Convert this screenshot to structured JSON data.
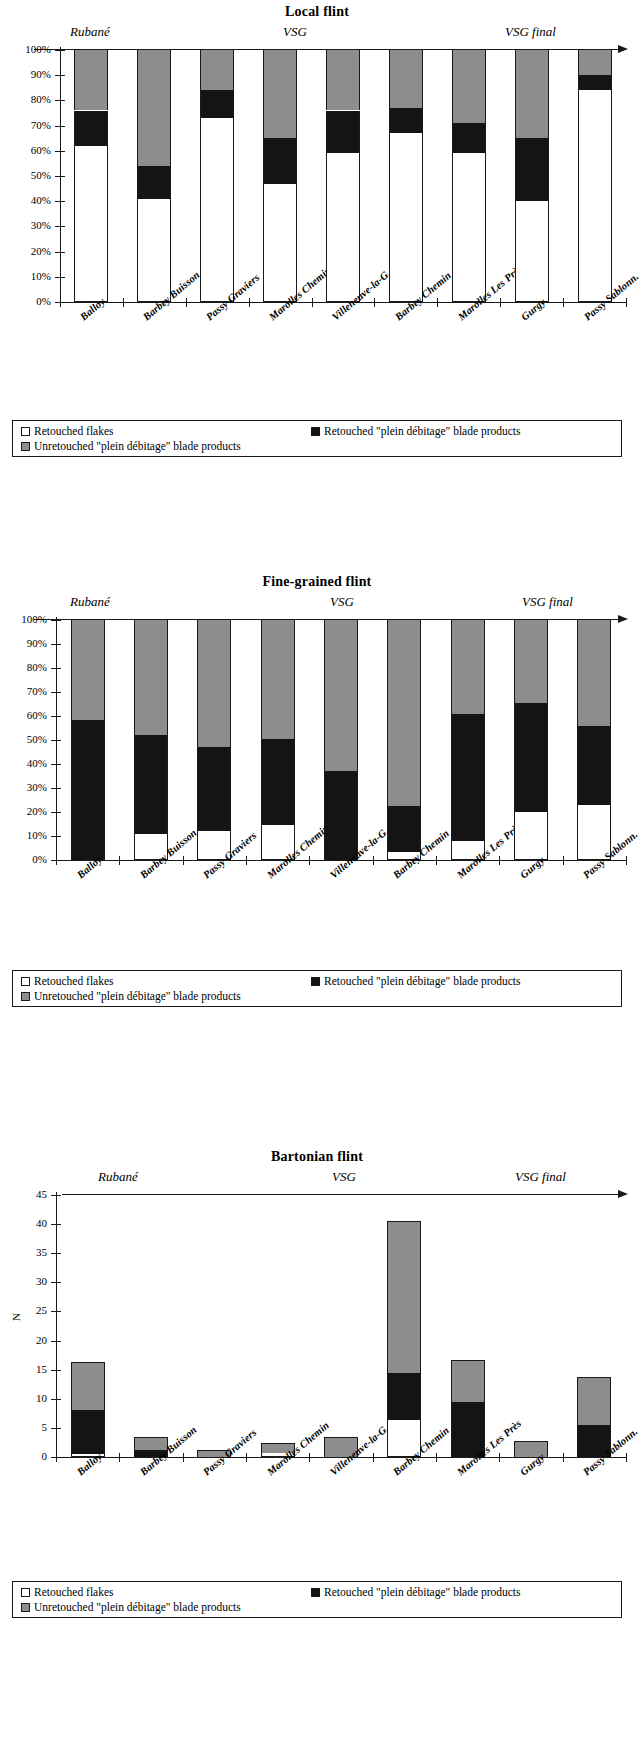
{
  "legend": {
    "items": [
      {
        "key": "retouched_flakes",
        "label": "Retouched flakes",
        "swatch": "white",
        "color": "#ffffff"
      },
      {
        "key": "retouched_blades",
        "label": "Retouched \"plein débitage\" blade products",
        "swatch": "black",
        "color": "#141414"
      },
      {
        "key": "unretouched_blades",
        "label": "Unretouched \"plein débitage\" blade products",
        "swatch": "grey",
        "color": "#8d8d8d"
      }
    ]
  },
  "phases": [
    {
      "label": "Rubané"
    },
    {
      "label": "VSG"
    },
    {
      "label": "VSG final"
    }
  ],
  "sites": [
    "Balloy",
    "Barbey Buisson",
    "Passy Graviers",
    "Marolles Chemin",
    "Villeneuve-la-G.",
    "Barbey Chemin",
    "Marolles Les Près",
    "Gurgy",
    "Passy Sablonn."
  ],
  "chart_data": [
    {
      "type": "bar",
      "stacked": true,
      "normalized": true,
      "title": "Local flint",
      "xlabel": "",
      "ylabel": "",
      "ylim": [
        0,
        100
      ],
      "yticks": [
        "0%",
        "10%",
        "20%",
        "30%",
        "40%",
        "50%",
        "60%",
        "70%",
        "80%",
        "90%",
        "100%"
      ],
      "grid": false,
      "legend_position": "below",
      "categories": [
        "Balloy",
        "Barbey Buisson",
        "Passy Graviers",
        "Marolles Chemin",
        "Villeneuve-la-G.",
        "Barbey Chemin",
        "Marolles Les Près",
        "Gurgy",
        "Passy Sablonn."
      ],
      "series": [
        {
          "name": "Retouched flakes",
          "color": "#ffffff",
          "values": [
            62,
            41,
            73,
            47,
            59,
            67,
            59,
            40,
            84
          ]
        },
        {
          "name": "Retouched \"plein débitage\" blade products",
          "color": "#141414",
          "values": [
            14,
            13,
            11,
            18,
            17,
            10,
            12,
            25,
            6
          ]
        },
        {
          "name": "Unretouched \"plein débitage\" blade products",
          "color": "#8d8d8d",
          "values": [
            24,
            46,
            16,
            35,
            24,
            23,
            29,
            35,
            10
          ]
        }
      ]
    },
    {
      "type": "bar",
      "stacked": true,
      "normalized": true,
      "title": "Fine-grained flint",
      "xlabel": "",
      "ylabel": "",
      "ylim": [
        0,
        100
      ],
      "yticks": [
        "0%",
        "10%",
        "20%",
        "30%",
        "40%",
        "50%",
        "60%",
        "70%",
        "80%",
        "90%",
        "100%"
      ],
      "grid": false,
      "legend_position": "below",
      "categories": [
        "Balloy",
        "Barbey Buisson",
        "Passy Graviers",
        "Marolles Chemin",
        "Villeneuve-la-G.",
        "Barbey Chemin",
        "Marolles Les Près",
        "Gurgy",
        "Passy Sablonn."
      ],
      "series": [
        {
          "name": "Retouched flakes",
          "color": "#ffffff",
          "values": [
            0,
            11,
            12,
            14.5,
            0,
            3.5,
            8,
            20,
            23
          ]
        },
        {
          "name": "Retouched \"plein débitage\" blade products",
          "color": "#141414",
          "values": [
            58.5,
            41,
            35,
            36,
            37,
            19,
            53,
            45.5,
            33
          ]
        },
        {
          "name": "Unretouched \"plein débitage\" blade products",
          "color": "#8d8d8d",
          "values": [
            41.5,
            48,
            53,
            49.5,
            63,
            77.5,
            39,
            34.5,
            44
          ]
        }
      ]
    },
    {
      "type": "bar",
      "stacked": true,
      "normalized": false,
      "title": "Bartonian flint",
      "xlabel": "",
      "ylabel": "N",
      "ylim": [
        0,
        45
      ],
      "yticks": [
        "0",
        "5",
        "10",
        "15",
        "20",
        "25",
        "30",
        "35",
        "40",
        "45"
      ],
      "grid": false,
      "legend_position": "below",
      "categories": [
        "Balloy",
        "Barbey Buisson",
        "Passy Graviers",
        "Marolles Chemin",
        "Villeneuve-la-G.",
        "Barbey Chemin",
        "Marolles Les Près",
        "Gurgy",
        "Passy Sablonn."
      ],
      "series": [
        {
          "name": "Retouched flakes",
          "color": "#ffffff",
          "values": [
            0.6,
            0,
            0,
            0.7,
            0,
            6.3,
            0,
            0,
            0
          ]
        },
        {
          "name": "Retouched \"plein débitage\" blade products",
          "color": "#141414",
          "values": [
            7.4,
            1.2,
            0,
            0,
            0,
            8.1,
            9.5,
            0,
            5.5
          ]
        },
        {
          "name": "Unretouched \"plein débitage\" blade products",
          "color": "#8d8d8d",
          "values": [
            8.1,
            2.0,
            1.1,
            1.6,
            3.3,
            26.0,
            7.0,
            2.5,
            8.0
          ]
        }
      ],
      "totals": [
        16.1,
        3.2,
        1.1,
        2.3,
        3.3,
        40.4,
        16.5,
        2.5,
        13.5
      ]
    }
  ]
}
